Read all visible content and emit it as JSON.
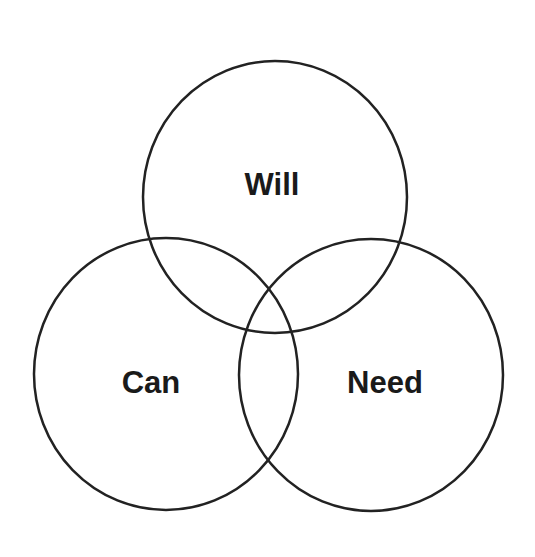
{
  "diagram": {
    "type": "venn",
    "stroke_color": "#222222",
    "background": "#ffffff",
    "sets": [
      {
        "id": "will",
        "label": "Will",
        "cx": 275,
        "cy": 197,
        "rx": 132,
        "ry": 136,
        "label_x": 272,
        "label_y": 195
      },
      {
        "id": "can",
        "label": "Can",
        "cx": 166,
        "cy": 374,
        "rx": 132,
        "ry": 136,
        "label_x": 151,
        "label_y": 393
      },
      {
        "id": "need",
        "label": "Need",
        "cx": 371,
        "cy": 375,
        "rx": 132,
        "ry": 136,
        "label_x": 385,
        "label_y": 393
      }
    ]
  }
}
